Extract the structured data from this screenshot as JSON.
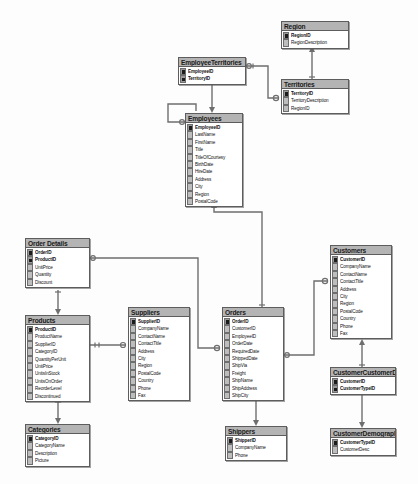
{
  "diagram": {
    "type": "entity-relationship-diagram",
    "canvas": {
      "width": 418,
      "height": 484
    },
    "colors": {
      "background": "#fdfdfd",
      "table_header": "#b4b4b4",
      "table_body": "#ffffff",
      "border": "#5d5d5d",
      "connector": "#6e6e6e",
      "key_marker": "#1c1c1c",
      "text": "#111111"
    }
  },
  "tables": [
    {
      "id": "region",
      "name": "Region",
      "x": 281,
      "y": 21,
      "w": 68,
      "fields": [
        {
          "name": "RegionID",
          "pk": true
        },
        {
          "name": "RegionDescription",
          "pk": false
        }
      ]
    },
    {
      "id": "employee_territories",
      "name": "EmployeeTerritories",
      "x": 178,
      "y": 57,
      "w": 68,
      "fields": [
        {
          "name": "EmployeeID",
          "pk": true
        },
        {
          "name": "TerritoryID",
          "pk": true
        }
      ]
    },
    {
      "id": "territories",
      "name": "Territories",
      "x": 281,
      "y": 79,
      "w": 68,
      "fields": [
        {
          "name": "TerritoryID",
          "pk": true
        },
        {
          "name": "TerritoryDescription",
          "pk": false
        },
        {
          "name": "RegionID",
          "pk": false
        }
      ]
    },
    {
      "id": "employees",
      "name": "Employees",
      "x": 185,
      "y": 113,
      "w": 58,
      "fields": [
        {
          "name": "EmployeeID",
          "pk": true
        },
        {
          "name": "LastName",
          "pk": false
        },
        {
          "name": "FirstName",
          "pk": false
        },
        {
          "name": "Title",
          "pk": false
        },
        {
          "name": "TitleOfCourtesy",
          "pk": false
        },
        {
          "name": "BirthDate",
          "pk": false
        },
        {
          "name": "HireDate",
          "pk": false
        },
        {
          "name": "Address",
          "pk": false
        },
        {
          "name": "City",
          "pk": false
        },
        {
          "name": "Region",
          "pk": false
        },
        {
          "name": "PostalCode",
          "pk": false
        }
      ]
    },
    {
      "id": "order_details",
      "name": "Order Details",
      "x": 25,
      "y": 238,
      "w": 65,
      "fields": [
        {
          "name": "OrderID",
          "pk": true
        },
        {
          "name": "ProductID",
          "pk": true
        },
        {
          "name": "UnitPrice",
          "pk": false
        },
        {
          "name": "Quantity",
          "pk": false
        },
        {
          "name": "Discount",
          "pk": false
        }
      ]
    },
    {
      "id": "customers",
      "name": "Customers",
      "x": 330,
      "y": 245,
      "w": 62,
      "fields": [
        {
          "name": "CustomerID",
          "pk": true
        },
        {
          "name": "CompanyName",
          "pk": false
        },
        {
          "name": "ContactName",
          "pk": false
        },
        {
          "name": "ContactTitle",
          "pk": false
        },
        {
          "name": "Address",
          "pk": false
        },
        {
          "name": "City",
          "pk": false
        },
        {
          "name": "Region",
          "pk": false
        },
        {
          "name": "PostalCode",
          "pk": false
        },
        {
          "name": "Country",
          "pk": false
        },
        {
          "name": "Phone",
          "pk": false
        },
        {
          "name": "Fax",
          "pk": false
        }
      ]
    },
    {
      "id": "products",
      "name": "Products",
      "x": 25,
      "y": 315,
      "w": 65,
      "fields": [
        {
          "name": "ProductID",
          "pk": true
        },
        {
          "name": "ProductName",
          "pk": false
        },
        {
          "name": "SupplierID",
          "pk": false
        },
        {
          "name": "CategoryID",
          "pk": false
        },
        {
          "name": "QuantityPerUnit",
          "pk": false
        },
        {
          "name": "UnitPrice",
          "pk": false
        },
        {
          "name": "UnitsInStock",
          "pk": false
        },
        {
          "name": "UnitsOnOrder",
          "pk": false
        },
        {
          "name": "ReorderLevel",
          "pk": false
        },
        {
          "name": "Discontinued",
          "pk": false
        }
      ]
    },
    {
      "id": "suppliers",
      "name": "Suppliers",
      "x": 128,
      "y": 307,
      "w": 62,
      "fields": [
        {
          "name": "SupplierID",
          "pk": true
        },
        {
          "name": "CompanyName",
          "pk": false
        },
        {
          "name": "ContactName",
          "pk": false
        },
        {
          "name": "ContactTitle",
          "pk": false
        },
        {
          "name": "Address",
          "pk": false
        },
        {
          "name": "City",
          "pk": false
        },
        {
          "name": "Region",
          "pk": false
        },
        {
          "name": "PostalCode",
          "pk": false
        },
        {
          "name": "Country",
          "pk": false
        },
        {
          "name": "Phone",
          "pk": false
        },
        {
          "name": "Fax",
          "pk": false
        }
      ]
    },
    {
      "id": "orders",
      "name": "Orders",
      "x": 222,
      "y": 307,
      "w": 62,
      "fields": [
        {
          "name": "OrderID",
          "pk": true
        },
        {
          "name": "CustomerID",
          "pk": false
        },
        {
          "name": "EmployeeID",
          "pk": false
        },
        {
          "name": "OrderDate",
          "pk": false
        },
        {
          "name": "RequiredDate",
          "pk": false
        },
        {
          "name": "ShippedDate",
          "pk": false
        },
        {
          "name": "ShipVia",
          "pk": false
        },
        {
          "name": "Freight",
          "pk": false
        },
        {
          "name": "ShipName",
          "pk": false
        },
        {
          "name": "ShipAddress",
          "pk": false
        },
        {
          "name": "ShipCity",
          "pk": false
        }
      ]
    },
    {
      "id": "customer_customer_demo",
      "name": "CustomerCustomerDemo",
      "x": 330,
      "y": 367,
      "w": 66,
      "fields": [
        {
          "name": "CustomerID",
          "pk": true
        },
        {
          "name": "CustomerTypeID",
          "pk": true
        }
      ]
    },
    {
      "id": "categories",
      "name": "Categories",
      "x": 25,
      "y": 424,
      "w": 65,
      "fields": [
        {
          "name": "CategoryID",
          "pk": true
        },
        {
          "name": "CategoryName",
          "pk": false
        },
        {
          "name": "Description",
          "pk": false
        },
        {
          "name": "Picture",
          "pk": false
        }
      ]
    },
    {
      "id": "shippers",
      "name": "Shippers",
      "x": 225,
      "y": 426,
      "w": 62,
      "fields": [
        {
          "name": "ShipperID",
          "pk": true
        },
        {
          "name": "CompanyName",
          "pk": false
        },
        {
          "name": "Phone",
          "pk": false
        }
      ]
    },
    {
      "id": "customer_demographics",
      "name": "CustomerDemographics",
      "x": 330,
      "y": 428,
      "w": 66,
      "fields": [
        {
          "name": "CustomerTypeID",
          "pk": true
        },
        {
          "name": "CustomerDesc",
          "pk": false
        }
      ]
    }
  ],
  "relationships": [
    {
      "from": "territories",
      "to": "region",
      "label": "Territories.RegionID -> Region.RegionID"
    },
    {
      "from": "employee_territories",
      "to": "territories",
      "label": "EmployeeTerritories.TerritoryID -> Territories.TerritoryID"
    },
    {
      "from": "employee_territories",
      "to": "employees",
      "label": "EmployeeTerritories.EmployeeID -> Employees.EmployeeID"
    },
    {
      "from": "employees",
      "to": "employees",
      "label": "Employees.ReportsTo -> Employees.EmployeeID"
    },
    {
      "from": "orders",
      "to": "employees",
      "label": "Orders.EmployeeID -> Employees.EmployeeID"
    },
    {
      "from": "order_details",
      "to": "orders",
      "label": "Order Details.OrderID -> Orders.OrderID"
    },
    {
      "from": "order_details",
      "to": "products",
      "label": "Order Details.ProductID -> Products.ProductID"
    },
    {
      "from": "products",
      "to": "suppliers",
      "label": "Products.SupplierID -> Suppliers.SupplierID"
    },
    {
      "from": "products",
      "to": "categories",
      "label": "Products.CategoryID -> Categories.CategoryID"
    },
    {
      "from": "orders",
      "to": "customers",
      "label": "Orders.CustomerID -> Customers.CustomerID"
    },
    {
      "from": "orders",
      "to": "shippers",
      "label": "Orders.ShipVia -> Shippers.ShipperID"
    },
    {
      "from": "customer_customer_demo",
      "to": "customers",
      "label": "CustomerCustomerDemo.CustomerID -> Customers.CustomerID"
    },
    {
      "from": "customer_customer_demo",
      "to": "customer_demographics",
      "label": "CustomerCustomerDemo.CustomerTypeID -> CustomerDemographics.CustomerTypeID"
    }
  ]
}
